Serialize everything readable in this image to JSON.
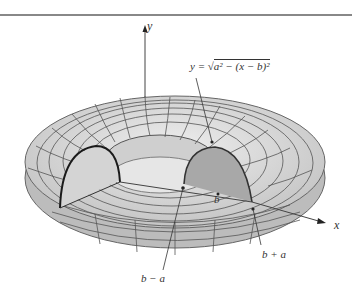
{
  "figure": {
    "axes": {
      "y_label": "y",
      "x_label": "x"
    },
    "equation": {
      "lhs": "y =",
      "radicand": "a² − (x − b)²",
      "full": "y = √(a² − (x − b)²)"
    },
    "labels": {
      "center": "b",
      "inner": "b − a",
      "outer": "b + a"
    },
    "colors": {
      "torus_fill": "#d9d9d9",
      "torus_shadow": "#bdbdbd",
      "mesh_line": "#555555",
      "left_section": "#d4d4d4",
      "right_section": "#a9a9a9",
      "section_edge": "#222222",
      "axis": "#444444"
    }
  }
}
